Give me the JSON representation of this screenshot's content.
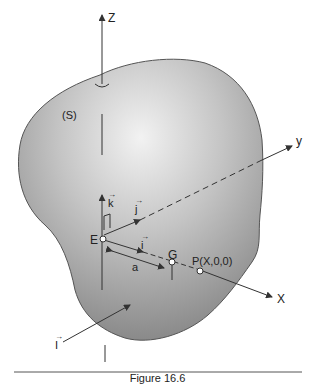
{
  "diagram": {
    "body_label": "(S)",
    "axes": {
      "z": "Z",
      "y": "y",
      "x": "X"
    },
    "points": {
      "E": "E",
      "G": "G",
      "P": "P(X,0,0)"
    },
    "unit_vectors": {
      "i": "i",
      "j": "j",
      "k": "k"
    },
    "distance_label": "a",
    "external_vector": "I",
    "colors": {
      "body_fill_light": "#e6e6e6",
      "body_fill_dark": "#8a8a8a",
      "outline": "#555555",
      "line": "#333333"
    }
  },
  "caption": "Figure 16.6"
}
